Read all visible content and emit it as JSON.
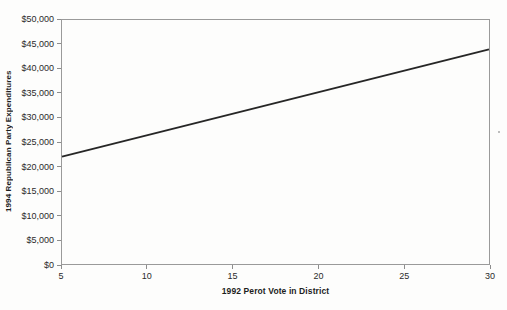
{
  "chart_data": {
    "type": "line",
    "title": "",
    "xlabel": "1992 Perot Vote in District",
    "ylabel": "1994 Republican Party Expenditures",
    "xlim": [
      5,
      30
    ],
    "ylim": [
      0,
      50000
    ],
    "xticks": [
      5,
      10,
      15,
      20,
      25,
      30
    ],
    "xtick_labels": [
      "5",
      "10",
      "15",
      "20",
      "25",
      "30"
    ],
    "yticks": [
      0,
      5000,
      10000,
      15000,
      20000,
      25000,
      30000,
      35000,
      40000,
      45000,
      50000
    ],
    "ytick_labels": [
      "$0",
      "$5,000",
      "$10,000",
      "$15,000",
      "$20,000",
      "$25,000",
      "$30,000",
      "$35,000",
      "$40,000",
      "$45,000",
      "$50,000"
    ],
    "grid": false,
    "legend_position": null,
    "series": [
      {
        "x": [
          5,
          30
        ],
        "y": [
          22000,
          44000
        ],
        "color": "#262626",
        "stroke_width": 1.8
      }
    ]
  },
  "colors": {
    "background": "#fdfdfc",
    "frame": "#9a9a9a",
    "tick": "#8d8d8d",
    "text": "#2b2b2b",
    "line": "#262626"
  }
}
